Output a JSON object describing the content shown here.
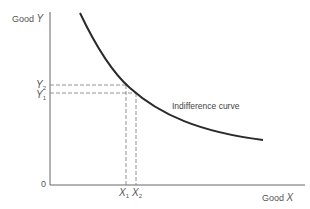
{
  "diagram": {
    "type": "indifference-curve",
    "y_axis_label_prefix": "Good ",
    "y_axis_label_var": "Y",
    "x_axis_label_prefix": "Good ",
    "x_axis_label_var": "X",
    "origin_label": "0",
    "curve_label": "Indifference curve",
    "y_ticks": [
      {
        "var": "Y",
        "sub": "2"
      },
      {
        "var": "Y",
        "sub": "1"
      }
    ],
    "x_ticks": [
      {
        "var": "X",
        "sub": "1"
      },
      {
        "var": "X",
        "sub": "2"
      }
    ],
    "colors": {
      "curve": "#2a2a2a",
      "axis": "#555555",
      "dashed": "#666666",
      "text": "#555555"
    }
  }
}
